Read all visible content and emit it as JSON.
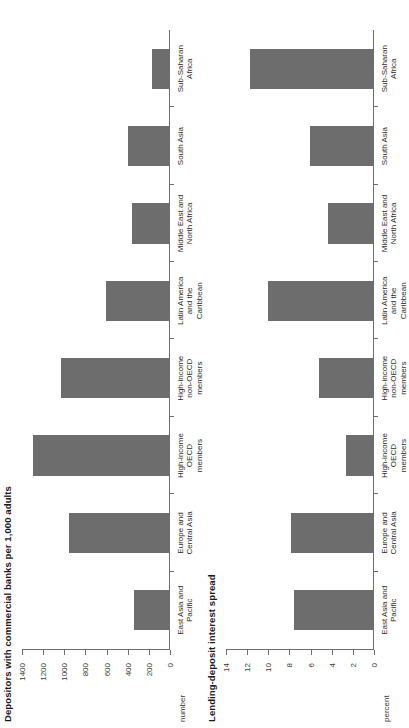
{
  "chart_data": [
    {
      "type": "bar",
      "title": "Depositors with commercial banks per 1,000 adults",
      "ylabel": "number",
      "xlabel": "",
      "ylim": [
        0,
        1400
      ],
      "yticks": [
        0,
        200,
        400,
        600,
        800,
        1000,
        1200,
        1400
      ],
      "ytick_labels": [
        "0",
        "200",
        "400",
        "600",
        "800",
        "1000",
        "1200",
        "1400"
      ],
      "grid": false,
      "legend": "none",
      "bar_color": "#6d6d6d",
      "categories": [
        "East Asia and\nPacific",
        "Europe and\nCentral Asia",
        "High-income\nOECD\nmembers",
        "High-income\nnon-OECD\nmembers",
        "Latin America\nand the\nCaribbean",
        "Middle East and\nNorth Africa",
        "South Asia",
        "Sub-Saharan\nAfrica"
      ],
      "values": [
        330,
        950,
        1290,
        1020,
        600,
        350,
        390,
        165
      ]
    },
    {
      "type": "bar",
      "title": "Lending-deposit interest spread",
      "ylabel": "percent",
      "xlabel": "",
      "ylim": [
        0,
        14
      ],
      "yticks": [
        0,
        2,
        4,
        6,
        8,
        10,
        12,
        14
      ],
      "ytick_labels": [
        "0",
        "2",
        "4",
        "6",
        "8",
        "10",
        "12",
        "14"
      ],
      "grid": false,
      "legend": "none",
      "bar_color": "#6d6d6d",
      "categories": [
        "East Asia and\nPacific",
        "Europe and\nCentral Asia",
        "High-income\nOECD\nmembers",
        "High-income\nnon-OECD\nmembers",
        "Latin America\nand the\nCaribbean",
        "Middle East and\nNorth Africa",
        "South Asia",
        "Sub-Saharan\nAfrica"
      ],
      "values": [
        7.5,
        7.8,
        2.6,
        5.1,
        9.9,
        4.3,
        6.0,
        11.6
      ]
    }
  ]
}
